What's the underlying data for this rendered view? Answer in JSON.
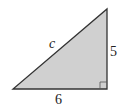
{
  "diagram": {
    "type": "right-triangle",
    "fill_color": "#d0d0d0",
    "stroke_color": "#333333",
    "vertices": {
      "top": [
        107,
        9
      ],
      "bottom_left": [
        13,
        89
      ],
      "bottom_right": [
        107,
        89
      ]
    },
    "labels": {
      "hypotenuse": "c",
      "vertical_leg": "5",
      "horizontal_leg": "6"
    },
    "right_angle_marker": true
  }
}
